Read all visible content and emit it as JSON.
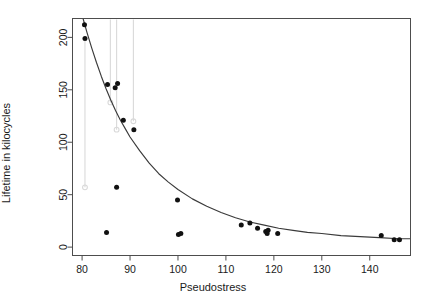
{
  "figure": {
    "name": "pseudostress-lifetime-scatter",
    "width": 426,
    "height": 306,
    "background": "#ffffff",
    "frame_color": "#4d4d4d",
    "point_color": "#111111",
    "curve_color": "#3a3a3a",
    "censor_color": "#d9d9d9"
  },
  "chart_data": {
    "type": "scatter",
    "title": "",
    "subtitle": "",
    "xlabel": "Pseudostress",
    "ylabel": "Lifetime in kilocycles",
    "xlim": [
      78.0,
      148.5
    ],
    "ylim": [
      -8.0,
      218.0
    ],
    "xticks": [
      80,
      90,
      100,
      110,
      120,
      130,
      140
    ],
    "yticks": [
      0,
      50,
      100,
      150,
      200
    ],
    "xtick_labels": [
      "80",
      "90",
      "100",
      "110",
      "120",
      "130",
      "140"
    ],
    "ytick_labels": [
      "0",
      "50",
      "100",
      "150",
      "200"
    ],
    "grid": false,
    "legend": null,
    "legend_position": "none",
    "annotations": [],
    "series": [
      {
        "name": "Observed lifetimes",
        "marker": "filled-circle",
        "color": "#111111",
        "points": [
          {
            "x": 80.5,
            "y": 212
          },
          {
            "x": 80.6,
            "y": 199
          },
          {
            "x": 85.3,
            "y": 155
          },
          {
            "x": 86.9,
            "y": 152
          },
          {
            "x": 87.4,
            "y": 156
          },
          {
            "x": 88.6,
            "y": 121
          },
          {
            "x": 90.8,
            "y": 112
          },
          {
            "x": 87.2,
            "y": 57
          },
          {
            "x": 85.1,
            "y": 14
          },
          {
            "x": 99.9,
            "y": 45
          },
          {
            "x": 100.1,
            "y": 12
          },
          {
            "x": 100.6,
            "y": 13
          },
          {
            "x": 113.2,
            "y": 21
          },
          {
            "x": 115.0,
            "y": 23
          },
          {
            "x": 116.6,
            "y": 18
          },
          {
            "x": 118.3,
            "y": 15
          },
          {
            "x": 118.6,
            "y": 13
          },
          {
            "x": 118.8,
            "y": 16
          },
          {
            "x": 120.8,
            "y": 13
          },
          {
            "x": 142.4,
            "y": 11
          },
          {
            "x": 145.1,
            "y": 7
          },
          {
            "x": 146.2,
            "y": 7
          }
        ]
      },
      {
        "name": "Censored intervals",
        "marker": "vertical-segment-open-circle",
        "color": "#d9d9d9",
        "segments": [
          {
            "x": 80.6,
            "y_top": 199,
            "y_bottom": 57
          },
          {
            "x": 85.9,
            "y_top": 217,
            "y_bottom": 138
          },
          {
            "x": 87.2,
            "y_top": 217,
            "y_bottom": 112
          },
          {
            "x": 90.7,
            "y_top": 217,
            "y_bottom": 120
          }
        ]
      },
      {
        "name": "Fitted curve",
        "marker": "line",
        "color": "#3a3a3a",
        "points": [
          {
            "x": 80.2,
            "y": 218
          },
          {
            "x": 81.0,
            "y": 205
          },
          {
            "x": 82.0,
            "y": 190
          },
          {
            "x": 83.0,
            "y": 176
          },
          {
            "x": 84.0,
            "y": 163
          },
          {
            "x": 85.0,
            "y": 151
          },
          {
            "x": 86.0,
            "y": 140
          },
          {
            "x": 87.0,
            "y": 130
          },
          {
            "x": 88.0,
            "y": 121
          },
          {
            "x": 89.0,
            "y": 113
          },
          {
            "x": 90.0,
            "y": 105
          },
          {
            "x": 92.0,
            "y": 92
          },
          {
            "x": 94.0,
            "y": 80
          },
          {
            "x": 96.0,
            "y": 70
          },
          {
            "x": 98.0,
            "y": 62
          },
          {
            "x": 100.0,
            "y": 55
          },
          {
            "x": 103.0,
            "y": 46
          },
          {
            "x": 106.0,
            "y": 39
          },
          {
            "x": 109.0,
            "y": 33
          },
          {
            "x": 112.0,
            "y": 28
          },
          {
            "x": 115.0,
            "y": 24
          },
          {
            "x": 118.0,
            "y": 21
          },
          {
            "x": 121.0,
            "y": 18
          },
          {
            "x": 124.0,
            "y": 16
          },
          {
            "x": 127.0,
            "y": 14
          },
          {
            "x": 130.0,
            "y": 13
          },
          {
            "x": 134.0,
            "y": 11
          },
          {
            "x": 138.0,
            "y": 10
          },
          {
            "x": 142.0,
            "y": 9
          },
          {
            "x": 146.0,
            "y": 8
          },
          {
            "x": 148.5,
            "y": 8
          }
        ]
      }
    ]
  }
}
